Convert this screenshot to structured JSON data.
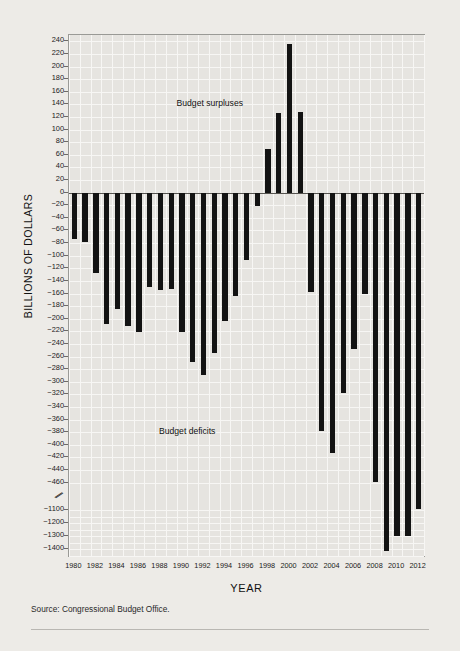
{
  "chart_data": {
    "type": "bar",
    "title": "",
    "xlabel": "YEAR",
    "ylabel": "BILLIONS OF DOLLARS",
    "annotations": [
      "Budget surpluses",
      "Budget deficits"
    ],
    "source": "Source: Congressional Budget Office.",
    "grid": true,
    "legend": "none",
    "axis_break": {
      "present": true,
      "between": [
        -460,
        -1100
      ]
    },
    "ylim_upper": [
      0,
      250
    ],
    "ylim_lower": [
      -1450,
      0
    ],
    "ytick_labels": [
      "240",
      "220",
      "200",
      "180",
      "160",
      "140",
      "120",
      "100",
      "80",
      "60",
      "40",
      "20",
      "0",
      "-20",
      "-40",
      "-60",
      "-80",
      "-100",
      "-120",
      "-140",
      "-160",
      "-180",
      "-200",
      "-220",
      "-240",
      "-260",
      "-280",
      "-300",
      "-320",
      "-340",
      "-360",
      "-380",
      "-400",
      "-420",
      "-440",
      "-460",
      "-1100",
      "-1200",
      "-1300",
      "-1400"
    ],
    "ytick_values": [
      240,
      220,
      200,
      180,
      160,
      140,
      120,
      100,
      80,
      60,
      40,
      20,
      0,
      -20,
      -40,
      -60,
      -80,
      -100,
      -120,
      -140,
      -160,
      -180,
      -200,
      -220,
      -240,
      -260,
      -280,
      -300,
      -320,
      -340,
      -360,
      -380,
      -400,
      -420,
      -440,
      -460,
      -1100,
      -1200,
      -1300,
      -1400
    ],
    "xtick_labels": [
      "1980",
      "1982",
      "1984",
      "1986",
      "1988",
      "1990",
      "1992",
      "1994",
      "1996",
      "1998",
      "2000",
      "2002",
      "2004",
      "2006",
      "2008",
      "2010",
      "2012"
    ],
    "categories": [
      1980,
      1981,
      1982,
      1983,
      1984,
      1985,
      1986,
      1987,
      1988,
      1989,
      1990,
      1991,
      1992,
      1993,
      1994,
      1995,
      1996,
      1997,
      1998,
      1999,
      2000,
      2001,
      2002,
      2003,
      2004,
      2005,
      2006,
      2007,
      2008,
      2009,
      2010,
      2011,
      2012
    ],
    "values": [
      -74,
      -79,
      -128,
      -208,
      -185,
      -212,
      -221,
      -150,
      -155,
      -153,
      -221,
      -269,
      -290,
      -255,
      -203,
      -164,
      -107,
      -22,
      69,
      126,
      236,
      128,
      -158,
      -378,
      -413,
      -318,
      -248,
      -161,
      -459,
      -1413,
      -1294,
      -1300,
      -1089
    ],
    "bar_color": "#131313",
    "plot_bg": "#e6e4e0",
    "page_bg": "#edebe7"
  },
  "labels": {
    "ytitle": "BILLIONS OF DOLLARS",
    "xtitle": "YEAR",
    "surplus_note": "Budget surpluses",
    "deficit_note": "Budget deficits",
    "source": "Source: Congressional Budget Office."
  }
}
